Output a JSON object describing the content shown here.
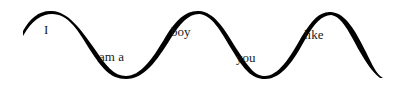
{
  "figure": {
    "background": "#ffffff",
    "stroke_color": "#000000",
    "words": [
      {
        "text": "I",
        "x": 44,
        "y": 24
      },
      {
        "text": "am a",
        "x": 99,
        "y": 51
      },
      {
        "text": "boy",
        "x": 171,
        "y": 26
      },
      {
        "text": "you",
        "x": 236,
        "y": 52
      },
      {
        "text": "like",
        "x": 304,
        "y": 29
      }
    ]
  }
}
